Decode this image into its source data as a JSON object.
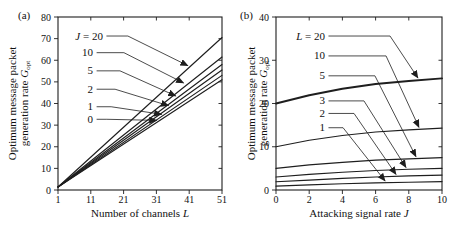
{
  "figure": {
    "background": "#ffffff",
    "ink_color": "#1e1e1e",
    "panel_a_label": "(a)",
    "panel_b_label": "(b)"
  },
  "chart_data": [
    {
      "type": "line",
      "panel_label": "(a)",
      "title": "",
      "xlabel": "Number of channels L",
      "xlabel_text": "Number of channels",
      "xlabel_var": "L",
      "ylabel": "Optimum message packet generation rate Gopt",
      "ylabel_line1": "Optimum message packet",
      "ylabel_line2_text": "generation rate",
      "ylabel_var": "G",
      "ylabel_var_sub": "opt",
      "xlim": [
        1,
        51
      ],
      "ylim": [
        0,
        80
      ],
      "xticks": [
        1,
        11,
        21,
        31,
        41,
        51
      ],
      "yticks": [
        0,
        10,
        20,
        30,
        40,
        50,
        60,
        70,
        80
      ],
      "grid": false,
      "legend_position": "inline-annotations",
      "series": [
        {
          "name": "J = 20",
          "emphasis": false,
          "points": [
            [
              1,
              1.4
            ],
            [
              51,
              70.5
            ]
          ]
        },
        {
          "name": "J = 10",
          "emphasis": false,
          "points": [
            [
              1,
              1.4
            ],
            [
              51,
              61.5
            ]
          ]
        },
        {
          "name": "J = 5",
          "emphasis": false,
          "points": [
            [
              1,
              1.4
            ],
            [
              51,
              58.0
            ]
          ]
        },
        {
          "name": "J = 2",
          "emphasis": false,
          "points": [
            [
              1,
              1.4
            ],
            [
              51,
              55.5
            ]
          ]
        },
        {
          "name": "J = 1",
          "emphasis": false,
          "points": [
            [
              1,
              1.4
            ],
            [
              51,
              53.0
            ]
          ]
        },
        {
          "name": "J = 0",
          "emphasis": false,
          "points": [
            [
              1,
              1.4
            ],
            [
              51,
              51.0
            ]
          ]
        }
      ],
      "annotations": [
        {
          "text": "J = 20",
          "label_x": 14.7,
          "label_y": 71.2,
          "elbow_x": 22.3,
          "tip_x": 40.6,
          "tip_y": 57.5
        },
        {
          "text": "10",
          "label_x": 11.7,
          "label_y": 63.5,
          "elbow_x": 21.1,
          "tip_x": 39.3,
          "tip_y": 49.5
        },
        {
          "text": "5",
          "label_x": 11.7,
          "label_y": 55.1,
          "elbow_x": 19.9,
          "tip_x": 36.9,
          "tip_y": 43.5
        },
        {
          "text": "2",
          "label_x": 11.7,
          "label_y": 46.6,
          "elbow_x": 18.4,
          "tip_x": 34.7,
          "tip_y": 39.0
        },
        {
          "text": "1",
          "label_x": 11.7,
          "label_y": 38.5,
          "elbow_x": 17.2,
          "tip_x": 32.6,
          "tip_y": 35.0
        },
        {
          "text": "0",
          "label_x": 11.7,
          "label_y": 32.7,
          "elbow_x": 15.9,
          "tip_x": 31.1,
          "tip_y": 32.2
        }
      ]
    },
    {
      "type": "line",
      "panel_label": "(b)",
      "title": "",
      "xlabel": "Attacking signal rate J",
      "xlabel_text": "Attacking signal rate",
      "xlabel_var": "J",
      "ylabel": "Optimum message packet generation rate Gopt",
      "ylabel_line1": "Optimum message packet",
      "ylabel_line2_text": "generation rate",
      "ylabel_var": "G",
      "ylabel_var_sub": "opt",
      "xlim": [
        0,
        10
      ],
      "ylim": [
        0,
        40
      ],
      "xticks": [
        0,
        2,
        4,
        6,
        8,
        10
      ],
      "yticks": [
        0,
        10,
        20,
        30,
        40
      ],
      "grid": false,
      "legend_position": "inline-annotations",
      "series": [
        {
          "name": "L = 20",
          "emphasis": true,
          "points": [
            [
              0,
              20.0
            ],
            [
              2,
              21.9
            ],
            [
              4,
              23.4
            ],
            [
              6,
              24.5
            ],
            [
              8,
              25.2
            ],
            [
              10,
              25.8
            ]
          ]
        },
        {
          "name": "L = 10",
          "emphasis": false,
          "points": [
            [
              0,
              10.0
            ],
            [
              2,
              11.5
            ],
            [
              4,
              12.6
            ],
            [
              6,
              13.4
            ],
            [
              8,
              13.9
            ],
            [
              10,
              14.3
            ]
          ]
        },
        {
          "name": "L = 5",
          "emphasis": false,
          "points": [
            [
              0,
              5.0
            ],
            [
              2,
              5.8
            ],
            [
              4,
              6.4
            ],
            [
              6,
              6.9
            ],
            [
              8,
              7.2
            ],
            [
              10,
              7.5
            ]
          ]
        },
        {
          "name": "L = 3",
          "emphasis": false,
          "points": [
            [
              0,
              3.0
            ],
            [
              2,
              3.6
            ],
            [
              4,
              4.1
            ],
            [
              6,
              4.5
            ],
            [
              8,
              4.8
            ],
            [
              10,
              5.0
            ]
          ]
        },
        {
          "name": "L = 2",
          "emphasis": false,
          "points": [
            [
              0,
              1.9
            ],
            [
              2,
              2.3
            ],
            [
              4,
              2.7
            ],
            [
              6,
              3.0
            ],
            [
              8,
              3.25
            ],
            [
              10,
              3.45
            ]
          ]
        },
        {
          "name": "L = 1",
          "emphasis": false,
          "points": [
            [
              0,
              0.9
            ],
            [
              2,
              1.2
            ],
            [
              4,
              1.45
            ],
            [
              6,
              1.65
            ],
            [
              8,
              1.8
            ],
            [
              10,
              1.95
            ]
          ]
        }
      ],
      "annotations": [
        {
          "text": "L = 20",
          "label_x": 2.95,
          "label_y": 35.6,
          "elbow_x": 6.87,
          "tip_x": 8.55,
          "tip_y": 25.9
        },
        {
          "text": "10",
          "label_x": 2.95,
          "label_y": 31.0,
          "elbow_x": 6.63,
          "tip_x": 8.61,
          "tip_y": 14.5
        },
        {
          "text": "5",
          "label_x": 2.95,
          "label_y": 26.4,
          "elbow_x": 5.96,
          "tip_x": 8.43,
          "tip_y": 7.7
        },
        {
          "text": "3",
          "label_x": 2.95,
          "label_y": 20.6,
          "elbow_x": 5.3,
          "tip_x": 7.83,
          "tip_y": 5.2
        },
        {
          "text": "2",
          "label_x": 2.95,
          "label_y": 17.7,
          "elbow_x": 4.7,
          "tip_x": 7.23,
          "tip_y": 3.6
        },
        {
          "text": "1",
          "label_x": 2.95,
          "label_y": 14.4,
          "elbow_x": 4.04,
          "tip_x": 6.57,
          "tip_y": 2.1
        }
      ]
    }
  ]
}
